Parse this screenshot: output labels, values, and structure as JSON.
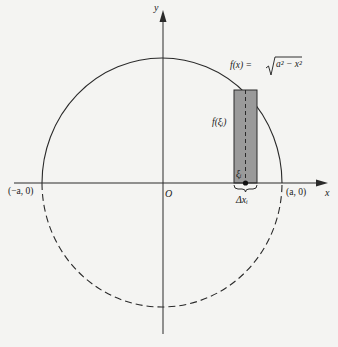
{
  "figure": {
    "colors": {
      "background": "#f4f4f2",
      "stroke": "#2a2a2a",
      "rect_fill": "#9a9a9a"
    },
    "axes": {
      "x_label": "x",
      "y_label": "y",
      "origin_label": "O"
    },
    "points": {
      "left": "(−a, 0)",
      "right": "(a, 0)"
    },
    "function_label": "f(x) = √(a² − x²)",
    "function_lhs": "f(x) =",
    "function_radicand": "a² − x²",
    "rect_height_label": "f(ξᵢ)",
    "sample_point_label": "ξᵢ",
    "width_label": "Δxᵢ"
  }
}
